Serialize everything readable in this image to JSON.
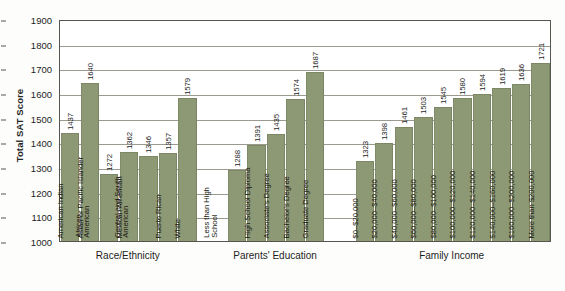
{
  "chart_data": {
    "type": "bar",
    "title": "",
    "subtitle": "",
    "xlabel": "",
    "ylabel": "Total SAT Score",
    "ylim": [
      1000,
      1900
    ],
    "ytick_step": 100,
    "yticks": [
      "1900",
      "1800",
      "1700",
      "1600",
      "1500",
      "1400",
      "1300",
      "1200",
      "1100",
      "1000"
    ],
    "grid": true,
    "legend": "none",
    "orientation": "vertical",
    "bar_color": "#8d9874",
    "groups": [
      {
        "name": "Race/Ethnicity",
        "categories": [
          "American Indian",
          "Asian or Pacific Islander",
          "African American",
          "Mexican American",
          "Central and South American",
          "Puerto Rican",
          "White"
        ],
        "category_lines": [
          [
            "American Indian"
          ],
          [
            "Asian or Pacific Islander"
          ],
          [
            "African",
            "American"
          ],
          [
            "Mexican American"
          ],
          [
            "Central and South",
            "American"
          ],
          [
            "Puerto Rican"
          ],
          [
            "White"
          ]
        ],
        "values": [
          1437,
          1640,
          1272,
          1362,
          1346,
          1357,
          1579
        ]
      },
      {
        "name": "Parents' Education",
        "categories": [
          "Less than High School",
          "High School Diploma",
          "Associate's Degree",
          "Bachelor's Degree",
          "Graduate Degree"
        ],
        "category_lines": [
          [
            "Less than High",
            "School"
          ],
          [
            "High School Diploma"
          ],
          [
            "Associate's Degree"
          ],
          [
            "Bachelor's Degree"
          ],
          [
            "Graduate Degree"
          ]
        ],
        "values": [
          1288,
          1391,
          1435,
          1574,
          1687
        ]
      },
      {
        "name": "Family Income",
        "categories": [
          "$0–$20,000",
          "$20,000–$40,000",
          "$40,000–$60,000",
          "$60,000–$80,000",
          "$80,000–$100,000",
          "$100,000–$120,000",
          "$120,000–$140,000",
          "$140,000–$160,000",
          "$160,000–$200,000",
          "More than $200,000"
        ],
        "category_lines": [
          [
            "$0–$20,000"
          ],
          [
            "$20,000–$40,000"
          ],
          [
            "$40,000–$60,000"
          ],
          [
            "$60,000–$80,000"
          ],
          [
            "$80,000–$100,000"
          ],
          [
            "$100,000–$120,000"
          ],
          [
            "$120,000–$140,000"
          ],
          [
            "$140,000–$160,000"
          ],
          [
            "$160,000–$200,000"
          ],
          [
            "More than $200,000"
          ]
        ],
        "values": [
          1323,
          1398,
          1461,
          1503,
          1545,
          1580,
          1594,
          1619,
          1636,
          1721
        ]
      }
    ]
  }
}
